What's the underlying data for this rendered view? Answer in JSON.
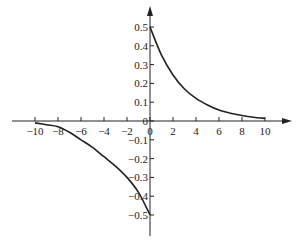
{
  "chart_data": {
    "type": "line",
    "title": "",
    "xlabel": "",
    "ylabel": "",
    "xlim": [
      -10,
      10
    ],
    "ylim": [
      -0.5,
      0.5
    ],
    "grid": false,
    "legend": null,
    "x_ticks": [
      "-10",
      "-8",
      "-6",
      "-4",
      "-2",
      "0",
      "2",
      "4",
      "6",
      "8",
      "10"
    ],
    "y_ticks": [
      "0.5",
      "0.4",
      "0.3",
      "0.2",
      "0.1",
      "0",
      "-0.1",
      "-0.2",
      "-0.3",
      "-0.4",
      "-0.5"
    ],
    "series": [
      {
        "name": "right branch",
        "x": [
          0,
          1,
          2,
          3,
          4,
          5,
          6,
          7,
          8,
          9,
          10
        ],
        "y": [
          0.5,
          0.35,
          0.245,
          0.17,
          0.12,
          0.085,
          0.058,
          0.041,
          0.029,
          0.02,
          0.014
        ]
      },
      {
        "name": "left branch",
        "x": [
          -10,
          -9,
          -8,
          -7,
          -6,
          -5,
          -4,
          -3,
          -2,
          -1,
          0
        ],
        "y": [
          -0.01,
          -0.02,
          -0.03,
          -0.06,
          -0.1,
          -0.14,
          -0.19,
          -0.24,
          -0.3,
          -0.38,
          -0.5
        ]
      }
    ],
    "colors": {
      "axis": "#222222",
      "curve": "#222222"
    }
  }
}
